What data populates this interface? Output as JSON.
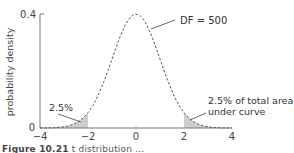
{
  "chart_data": {
    "type": "line",
    "title": "",
    "xlabel": "",
    "ylabel": "probability density",
    "xlim": [
      -4,
      4
    ],
    "ylim": [
      0,
      0.4
    ],
    "x_ticks": [
      "-4",
      "-2",
      "0",
      "2",
      "4"
    ],
    "y_ticks": [
      "0",
      "0.4"
    ],
    "grid": false,
    "series": [
      {
        "name": "t distribution, DF = 500",
        "style": "dashed",
        "x": [
          -4,
          -3.5,
          -3,
          -2.5,
          -2,
          -1.5,
          -1,
          -0.5,
          0,
          0.5,
          1,
          1.5,
          2,
          2.5,
          3,
          3.5,
          4
        ],
        "values": [
          0.0001,
          0.0009,
          0.0045,
          0.0176,
          0.0542,
          0.1297,
          0.2421,
          0.3521,
          0.3989,
          0.3521,
          0.2421,
          0.1297,
          0.0542,
          0.0176,
          0.0045,
          0.0009,
          0.0001
        ]
      }
    ],
    "shaded_regions": [
      {
        "from": -4,
        "to": -2,
        "label": "2.5%"
      },
      {
        "from": 2,
        "to": 4,
        "label": "2.5% of total area under curve"
      }
    ],
    "annotations": [
      {
        "text": "DF = 500",
        "points_to": "curve"
      },
      {
        "text": "2.5%",
        "points_to": "left tail"
      },
      {
        "text": "2.5% of total area",
        "line2": "under curve",
        "points_to": "right tail"
      }
    ]
  },
  "labels": {
    "ylabel": "probability density",
    "ytick_top": "0.4",
    "ytick_bottom": "0",
    "xticks": [
      "−4",
      "−2",
      "0",
      "2",
      "4"
    ],
    "df_label": "DF = 500",
    "left_tail_label": "2.5%",
    "right_tail_line1": "2.5% of total area",
    "right_tail_line2": "under curve"
  },
  "caption": {
    "prefix": "Figure 10.21",
    "text": "t distribution ..."
  }
}
